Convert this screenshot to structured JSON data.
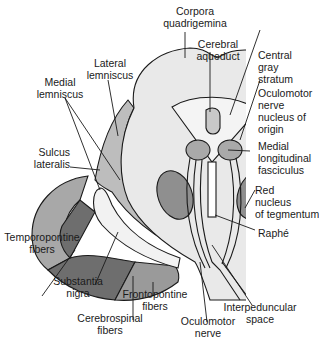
{
  "diagram": {
    "colors": {
      "outline": "#1a1a1a",
      "tegmentum": "#e9e9e9",
      "central_gray": "#f4f4f4",
      "lemniscus": "#bdbdbd",
      "red_nucleus": "#8f8f8f",
      "oculomotor_nucleus": "#a9a9a9",
      "substantia_nigra": "#f2f2f2",
      "temporopontine": "#a8a8a8",
      "cerebrospinal": "#6e6e6e",
      "frontopontine": "#9a9a9a",
      "aqueduct": "#c8c8c8"
    },
    "labels": {
      "corpora_quadrigemina": "Corpora\nquadrigemina",
      "cerebral_aqueduct": "Cerebral\naqueduct",
      "lateral_lemniscus": "Lateral\nlemniscus",
      "medial_lemniscus": "Medial\nlemniscus",
      "central_gray_stratum": "Central\ngray\nstratum",
      "oculomotor_nucleus": "Oculomotor\nnerve\nnucleus of\norigin",
      "sulcus_lateralis": "Sulcus\nlateralis",
      "medial_longitudinal_fasciculus": "Medial\nlongitudinal\nfasciculus",
      "red_nucleus": "Red\nnucleus\nof tegmentum",
      "temporopontine_fibers": "Temporopontine\nfibers",
      "raphe": "Raphé",
      "substantia_nigra": "Substantia\nnigra",
      "frontopontine_fibers": "Frontopontine\nfibers",
      "cerebrospinal_fibers": "Cerebrospinal\nfibers",
      "oculomotor_nerve": "Oculomotor\nnerve",
      "interpeduncular_space": "Interpeduncular\nspace"
    }
  }
}
